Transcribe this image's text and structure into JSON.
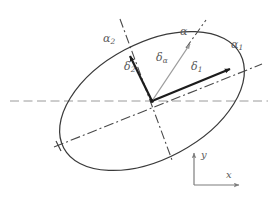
{
  "figure": {
    "background_color": "#ffffff",
    "width": 272,
    "height": 202,
    "colors": {
      "ellipse_stroke": "#3a3a3a",
      "vector_dark": "#1c1c1c",
      "vector_light": "#9a9a9a",
      "dashdot_line": "#4a4a4a",
      "horizontal_axis": "#9a9a9a",
      "label_text": "#5a5a5a",
      "coord_axis": "#7d7d7d"
    },
    "labels": {
      "alpha": "α",
      "alpha_1_base": "α",
      "alpha_1_sub": "1",
      "alpha_2_base": "α",
      "alpha_2_sub": "2",
      "delta_1_base": "δ",
      "delta_1_sub": "1",
      "delta_2_base": "δ",
      "delta_2_sub": "2",
      "delta_alpha_base": "δ",
      "delta_alpha_sub": "α",
      "axis_x": "x",
      "axis_y": "y"
    },
    "geometry": {
      "ellipse_center": [
        152,
        101
      ],
      "ellipse_semi_major": 100,
      "ellipse_semi_minor": 58,
      "ellipse_rotation_deg": -28,
      "origin_point": [
        152,
        101
      ],
      "delta_1_tip": [
        233,
        68
      ],
      "delta_2_tip": [
        128,
        52
      ],
      "delta_alpha_tip": [
        192,
        41
      ],
      "coord_corner": [
        194,
        185
      ],
      "coord_y_tip": [
        194,
        151
      ],
      "coord_x_tip": [
        241,
        185
      ]
    }
  }
}
